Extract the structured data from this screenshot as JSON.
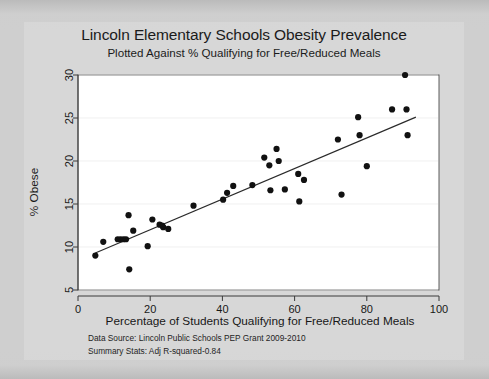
{
  "chart_data": {
    "type": "scatter",
    "title": "Lincoln Elementary Schools Obesity Prevalence",
    "subtitle": "Plotted Against % Qualifying for Free/Reduced Meals",
    "xlabel": "Percentage of Students Qualifying for Free/Reduced Meals",
    "ylabel": "% Obese",
    "xlim": [
      0,
      100
    ],
    "ylim": [
      5,
      30
    ],
    "xticks": [
      0,
      20,
      40,
      60,
      80,
      100
    ],
    "yticks": [
      5,
      10,
      15,
      20,
      25,
      30
    ],
    "grid": true,
    "grid_axis": "y",
    "legend": null,
    "marker": "filled-circle",
    "marker_color": "#111111",
    "points": [
      [
        4.8,
        9.0
      ],
      [
        7.0,
        10.6
      ],
      [
        11.0,
        10.9
      ],
      [
        11.8,
        10.9
      ],
      [
        12.6,
        10.9
      ],
      [
        13.3,
        10.9
      ],
      [
        14.0,
        13.7
      ],
      [
        14.2,
        7.4
      ],
      [
        15.3,
        11.9
      ],
      [
        19.3,
        10.1
      ],
      [
        20.6,
        13.2
      ],
      [
        22.6,
        12.6
      ],
      [
        23.3,
        12.5
      ],
      [
        23.6,
        12.3
      ],
      [
        25.0,
        12.1
      ],
      [
        32.0,
        14.8
      ],
      [
        40.2,
        15.5
      ],
      [
        41.3,
        16.3
      ],
      [
        43.0,
        17.1
      ],
      [
        48.3,
        17.2
      ],
      [
        51.6,
        20.4
      ],
      [
        53.0,
        19.5
      ],
      [
        53.3,
        16.6
      ],
      [
        55.0,
        21.4
      ],
      [
        55.6,
        20.0
      ],
      [
        57.3,
        16.7
      ],
      [
        61.0,
        18.5
      ],
      [
        61.3,
        15.3
      ],
      [
        62.6,
        17.8
      ],
      [
        72.0,
        22.5
      ],
      [
        73.0,
        16.1
      ],
      [
        77.6,
        25.1
      ],
      [
        78.0,
        23.0
      ],
      [
        80.0,
        19.4
      ],
      [
        87.0,
        26.0
      ],
      [
        90.6,
        30.0
      ],
      [
        91.0,
        26.0
      ],
      [
        91.3,
        23.0
      ]
    ],
    "fit_line": {
      "label": "linear-fit",
      "x0": 4.8,
      "y0": 9.3,
      "x1": 93.6,
      "y1": 25.1
    }
  },
  "footnotes": {
    "data_source": "Data Source: Lincoln Public Schools PEP Grant 2009-2010",
    "summary_stats": "Summary Stats: Adj R-squared-0.84"
  },
  "colors": {
    "page_background": "#cfcfcf",
    "panel_background": "#d7d7d7",
    "plot_background": "#ffffff",
    "marker": "#111111",
    "fit_line": "#2a2a2a",
    "text": "#1b1b1b",
    "gridline": "#e9e9e9",
    "frame": "#5c5c5c"
  }
}
